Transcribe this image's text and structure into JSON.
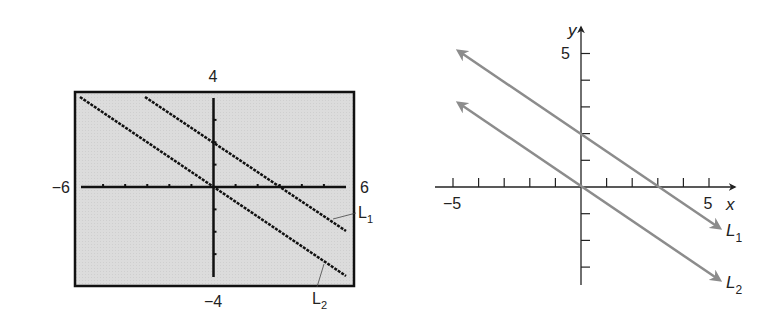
{
  "chart_data": [
    {
      "type": "line",
      "title": "",
      "description": "Graphing calculator screen",
      "window": {
        "xmin": -6,
        "xmax": 6,
        "ymin": -4,
        "ymax": 4,
        "xscl": 1,
        "yscl": 1
      },
      "tick_labels": {
        "xmin": "−6",
        "xmax": "6",
        "ymax": "4",
        "ymin": "−4"
      },
      "series": [
        {
          "name": "L1",
          "label": "L",
          "sub": "1",
          "slope": -0.6667,
          "intercept": 2,
          "x": [
            -3,
            6
          ],
          "y": [
            4,
            -2
          ]
        },
        {
          "name": "L2",
          "label": "L",
          "sub": "2",
          "slope": -0.6667,
          "intercept": 0,
          "x": [
            -6,
            6
          ],
          "y": [
            4,
            -4
          ]
        }
      ],
      "grid": false,
      "background": "#d9d9d9"
    },
    {
      "type": "line",
      "title": "",
      "xlabel": "x",
      "ylabel": "y",
      "xlim": [
        -5,
        5
      ],
      "ylim": [
        -3.7,
        5
      ],
      "tick_labels": {
        "x_neg": "−5",
        "x_pos": "5",
        "y_pos": "5"
      },
      "series": [
        {
          "name": "L1",
          "label": "L",
          "sub": "1",
          "slope": -0.6667,
          "intercept": 2,
          "x": [
            -4.8,
            5.3
          ],
          "y": [
            5.0,
            -1.6
          ]
        },
        {
          "name": "L2",
          "label": "L",
          "sub": "2",
          "slope": -0.6667,
          "intercept": 0,
          "x": [
            -4.8,
            5.3
          ],
          "y": [
            3.1,
            -3.5
          ]
        }
      ],
      "line_color": "#8c8c8c",
      "grid": false
    }
  ]
}
